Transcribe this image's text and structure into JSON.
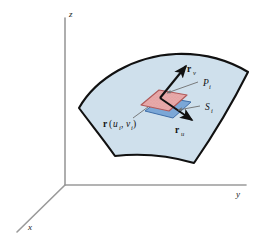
{
  "figure": {
    "kind": "parametric-surface-diagram",
    "background_color": "#ffffff",
    "axes": {
      "color": "#9a9a9a",
      "origin": {
        "x": 65,
        "y": 185
      },
      "labels": {
        "z": "z",
        "y": "y",
        "x": "x"
      }
    },
    "surface": {
      "name": "parametric-surface",
      "fill_color": "#cfe0ec",
      "stroke_color": "#111111"
    },
    "patch": {
      "top_fill": "#e8a9a9",
      "top_stroke": "#b05a5a",
      "bottom_fill": "#7ba7d7",
      "bottom_stroke": "#3f6ea8"
    },
    "vectors": {
      "color": "#111111",
      "rv_label_main": "r",
      "rv_label_sub": "v",
      "ru_label_main": "r",
      "ru_label_sub": "u"
    },
    "leaders": {
      "color": "#6e6e6e"
    },
    "annotations": {
      "point_P_main": "P",
      "point_P_sub": "i",
      "patch_S_main": "S",
      "patch_S_sub": "i",
      "position_vector_main": "r",
      "position_vector_open": "(",
      "position_vector_u": "u",
      "position_vector_u_sub": "i",
      "position_vector_comma": ", ",
      "position_vector_v": "v",
      "position_vector_v_sub": "i",
      "position_vector_close": ")"
    }
  }
}
